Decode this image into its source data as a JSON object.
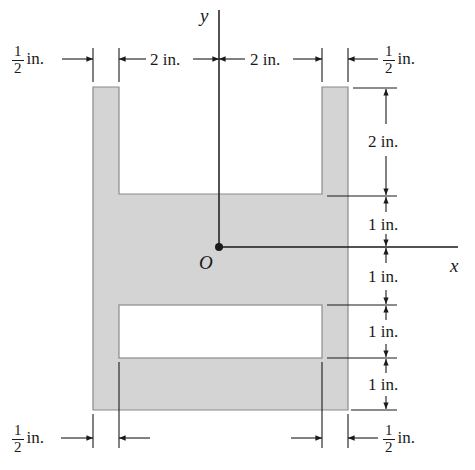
{
  "figure": {
    "colors": {
      "fill": "#d4d4d4",
      "stroke": "#8a8a8a",
      "line": "#1a1a1a",
      "background": "#ffffff"
    },
    "axes": {
      "x_label": "x",
      "y_label": "y",
      "origin_label": "O"
    },
    "dimensions": {
      "top_left_wall": {
        "num": "1",
        "den": "2",
        "unit": "in."
      },
      "top_left_gap": "2 in.",
      "top_right_gap": "2 in.",
      "top_right_wall": {
        "num": "1",
        "den": "2",
        "unit": "in."
      },
      "right_upper_slot_depth": "2 in.",
      "right_above_origin": "1 in.",
      "right_below_origin": "1 in.",
      "right_lower_slot_height": "1 in.",
      "right_bottom_band": "1 in.",
      "bottom_left_wall": {
        "num": "1",
        "den": "2",
        "unit": "in."
      },
      "bottom_right_wall": {
        "num": "1",
        "den": "2",
        "unit": "in."
      }
    }
  }
}
